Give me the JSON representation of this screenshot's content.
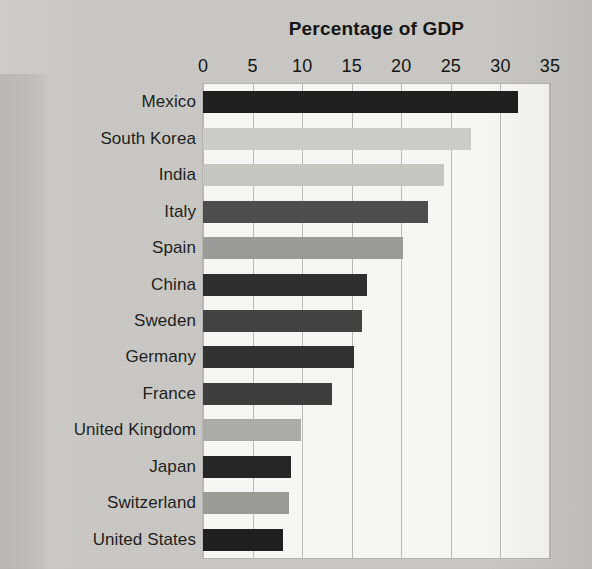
{
  "chart_data": {
    "type": "bar",
    "orientation": "horizontal",
    "title": "Percentage of GDP",
    "xlabel": "",
    "ylabel": "",
    "xlim": [
      0,
      35
    ],
    "xticks": [
      0,
      5,
      10,
      15,
      20,
      25,
      30,
      35
    ],
    "xtick_labels": [
      "0",
      "5",
      "10",
      "15",
      "20",
      "25",
      "30",
      "35"
    ],
    "grid": true,
    "legend": "none",
    "categories": [
      "Mexico",
      "South Korea",
      "India",
      "Italy",
      "Spain",
      "China",
      "Sweden",
      "Germany",
      "France",
      "United Kingdom",
      "Japan",
      "Switzerland",
      "United States"
    ],
    "values": [
      31.8,
      27.0,
      24.3,
      22.7,
      20.2,
      16.5,
      16.0,
      15.2,
      13.0,
      9.9,
      8.9,
      8.7,
      8.1
    ],
    "bar_colors": [
      "#1c1c1c",
      "#cfcfcd",
      "#c9c9c6",
      "#4b4b4b",
      "#9c9c9a",
      "#2c2c2c",
      "#404040",
      "#2f2f2f",
      "#3b3b3b",
      "#adadaa",
      "#232323",
      "#9b9b98",
      "#1c1c1c"
    ]
  },
  "page": {
    "background_color": "#cbcac6",
    "plot_background_color": "#fbfbfa",
    "gridline_color": "#bdbdb9",
    "text_color": "#111111"
  },
  "ghost_text": [
    "rved and stud",
    "nd France, Ital",
    "l and empirica",
    "distribution of in",
    "ween 1980 (mea"
  ]
}
